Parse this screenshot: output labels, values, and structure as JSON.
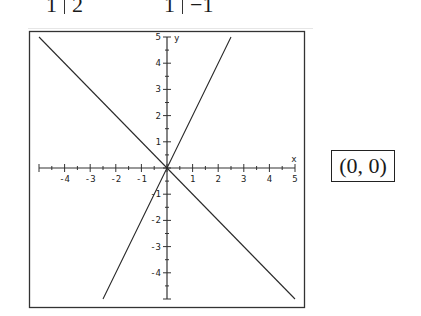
{
  "top_fragments": [
    {
      "left": "1",
      "right": "2"
    },
    {
      "left": "1",
      "right": "−1"
    }
  ],
  "answer_box": {
    "text": "(0, 0)"
  },
  "chart_data": {
    "type": "line",
    "title": "",
    "xlabel": "x",
    "ylabel": "y",
    "xlim": [
      -5,
      5
    ],
    "ylim": [
      -5,
      5
    ],
    "x_ticks": [
      "-4",
      "-3",
      "-2",
      "-1",
      "1",
      "2",
      "3",
      "4",
      "5"
    ],
    "y_ticks": [
      "5",
      "4",
      "3",
      "2",
      "1",
      "-1",
      "-2",
      "-3",
      "-4"
    ],
    "grid": false,
    "legend": null,
    "series": [
      {
        "name": "y = 2x",
        "points": [
          [
            -2.5,
            -5
          ],
          [
            0,
            0
          ],
          [
            2.5,
            5
          ]
        ]
      },
      {
        "name": "y = -x",
        "points": [
          [
            -5,
            5
          ],
          [
            0,
            0
          ],
          [
            5,
            -5
          ]
        ]
      }
    ],
    "annotations": [
      "intersection (0, 0)"
    ]
  }
}
